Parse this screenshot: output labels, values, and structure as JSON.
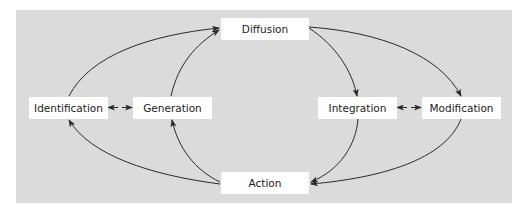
{
  "diagram": {
    "type": "cycle-flow",
    "background_color": "#dbdbdb",
    "node_color": "#ffffff",
    "edge_color": "#2a2a2a",
    "nodes": {
      "diffusion": "Diffusion",
      "identification": "Identification",
      "generation": "Generation",
      "integration": "Integration",
      "modification": "Modification",
      "action": "Action"
    },
    "edges": [
      {
        "from": "Identification",
        "to": "Diffusion",
        "style": "curved-arrow"
      },
      {
        "from": "Generation",
        "to": "Diffusion",
        "style": "curved-arrow"
      },
      {
        "from": "Diffusion",
        "to": "Integration",
        "style": "curved-arrow"
      },
      {
        "from": "Diffusion",
        "to": "Modification",
        "style": "curved-arrow"
      },
      {
        "from": "Integration",
        "to": "Action",
        "style": "curved-arrow"
      },
      {
        "from": "Modification",
        "to": "Action",
        "style": "curved-arrow"
      },
      {
        "from": "Action",
        "to": "Identification",
        "style": "curved-arrow"
      },
      {
        "from": "Action",
        "to": "Generation",
        "style": "curved-arrow"
      },
      {
        "from": "Identification",
        "to": "Generation",
        "style": "bidirectional"
      },
      {
        "from": "Integration",
        "to": "Modification",
        "style": "bidirectional"
      }
    ]
  }
}
